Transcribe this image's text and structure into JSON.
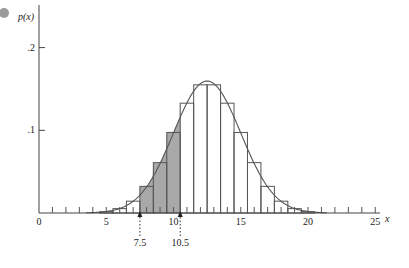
{
  "chart_data": {
    "type": "bar",
    "title": "",
    "xlabel": "x",
    "ylabel": "p(x)",
    "xlim": [
      0,
      25
    ],
    "ylim": [
      0,
      0.2
    ],
    "x_ticks": [
      0,
      5,
      10,
      15,
      20,
      25
    ],
    "y_ticks": [
      ".1",
      ".2"
    ],
    "y_tick_values": [
      0.1,
      0.2
    ],
    "grid": false,
    "categories": [
      5,
      6,
      7,
      8,
      9,
      10,
      11,
      12,
      13,
      14,
      15,
      16,
      17,
      18,
      19,
      20
    ],
    "values": [
      0.0016,
      0.0053,
      0.0143,
      0.0322,
      0.0609,
      0.0974,
      0.1328,
      0.155,
      0.155,
      0.1328,
      0.0974,
      0.0609,
      0.0322,
      0.0143,
      0.0053,
      0.0016
    ],
    "bar_width": 1,
    "shaded_region": {
      "from": 7.5,
      "to": 10.5,
      "color": "#a8a8a8"
    },
    "overlay_curve": {
      "type": "normal",
      "mean": 12.5,
      "sd": 2.5
    },
    "annotations": [
      {
        "label": "7.5",
        "x": 7.5,
        "style": "dotted-arrow"
      },
      {
        "label": "10.5",
        "x": 10.5,
        "style": "dotted-arrow"
      }
    ]
  },
  "labels": {
    "y_axis": "p(x)",
    "x_axis": "x",
    "ann_left": "7.5",
    "ann_right": "10.5"
  },
  "colors": {
    "line": "#555555",
    "shade": "#a8a8a8",
    "bullet": "#9a9a9a"
  }
}
